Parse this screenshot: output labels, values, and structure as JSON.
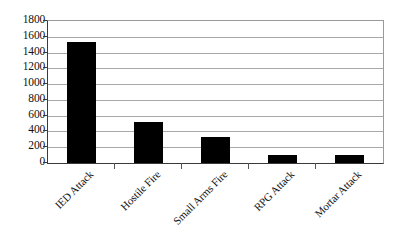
{
  "chart_data": {
    "type": "bar",
    "title": "",
    "subtitle": "",
    "xlabel": "",
    "ylabel": "",
    "categories": [
      "IED Attack",
      "Hostile Fire",
      "Small Arms Fire",
      "RPG Attack",
      "Mortar Attack"
    ],
    "values": [
      1530,
      520,
      325,
      100,
      105
    ],
    "ylim": [
      0,
      1800
    ],
    "ytick_interval": 200,
    "yticks": [
      0,
      200,
      400,
      600,
      800,
      1000,
      1200,
      1400,
      1600,
      1800
    ],
    "ytick_labels": [
      "0",
      "200",
      "400",
      "600",
      "800",
      "1000",
      "1200",
      "1400",
      "1600",
      "1800"
    ],
    "grid": true,
    "grid_axis": "y",
    "legend": false,
    "legend_position": "none",
    "series": [
      {
        "name": "",
        "values": [
          1530,
          520,
          325,
          100,
          105
        ],
        "color": "#000000"
      }
    ],
    "annotations": [],
    "colors": {
      "bar": "#000000",
      "gridline": "#a8a8a8",
      "axis": "#3a3a3a",
      "plot_border": "#9a9a9a",
      "text": "#111111",
      "background": "#ffffff"
    },
    "label_rotation_deg": -45
  }
}
